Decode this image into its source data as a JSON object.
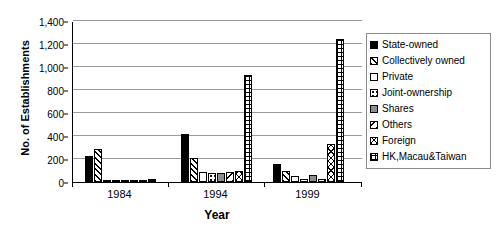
{
  "chart_data": {
    "type": "bar",
    "title": "",
    "xlabel": "Year",
    "ylabel": "No. of Establishments",
    "categories": [
      "1984",
      "1994",
      "1999"
    ],
    "ylim": [
      0,
      1400
    ],
    "yticks": [
      0,
      200,
      400,
      600,
      800,
      1000,
      1200,
      1400
    ],
    "ytick_labels": [
      "0",
      "200",
      "400",
      "600",
      "800",
      "1,000",
      "1,200",
      "1,400"
    ],
    "grid": true,
    "legend_position": "right",
    "series": [
      {
        "name": "State-owned",
        "pattern": "p-solid",
        "values": [
          230,
          420,
          155
        ]
      },
      {
        "name": "Collectively owned",
        "pattern": "p-hatch",
        "values": [
          290,
          205,
          100
        ]
      },
      {
        "name": "Private",
        "pattern": "p-white",
        "values": [
          15,
          85,
          55
        ]
      },
      {
        "name": "Joint-ownership",
        "pattern": "p-dots",
        "values": [
          5,
          75,
          25
        ]
      },
      {
        "name": "Shares",
        "pattern": "p-gray",
        "values": [
          5,
          80,
          60
        ]
      },
      {
        "name": "Others",
        "pattern": "p-backhatch",
        "values": [
          10,
          90,
          30
        ]
      },
      {
        "name": "Foreign",
        "pattern": "p-zigzag",
        "values": [
          20,
          95,
          330
        ]
      },
      {
        "name": "HK,Macau&Taiwan",
        "pattern": "p-grid",
        "values": [
          25,
          930,
          1240
        ]
      }
    ]
  },
  "legend": {
    "items": [
      {
        "label": "State-owned",
        "swatch": "p-solid"
      },
      {
        "label": "Collectively owned",
        "swatch": "p-hatch"
      },
      {
        "label": "Private",
        "swatch": "p-white"
      },
      {
        "label": "Joint-ownership",
        "swatch": "p-dots"
      },
      {
        "label": "Shares",
        "swatch": "p-gray"
      },
      {
        "label": "Others",
        "swatch": "p-backhatch"
      },
      {
        "label": "Foreign",
        "swatch": "p-zigzag"
      },
      {
        "label": "HK,Macau&Taiwan",
        "swatch": "p-grid"
      }
    ]
  }
}
